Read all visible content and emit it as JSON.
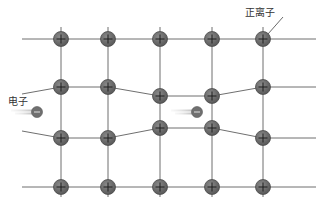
{
  "diagram": {
    "type": "metal-lattice",
    "labels": {
      "positive_ion": "正离子",
      "electron": "电子"
    },
    "colors": {
      "line": "#6f6f6f",
      "ion_fill": "#6a6a6a",
      "ion_stroke": "#4a4a4a",
      "ion_symbol": "#1e1e1e",
      "electron_fill": "#707070",
      "trail": "#cfcfcf"
    },
    "grid": {
      "x_start": 22,
      "x_end": 316,
      "columns": [
        61,
        108,
        160,
        212,
        263
      ],
      "rows": [
        {
          "ys": [
            39,
            39,
            39,
            39,
            39
          ],
          "y_left": 39,
          "y_right": 39
        },
        {
          "ys": [
            87,
            87,
            96,
            96,
            87
          ],
          "y_left": 94,
          "y_right": 87
        },
        {
          "ys": [
            138,
            138,
            128,
            128,
            138
          ],
          "y_left": 131,
          "y_right": 138
        },
        {
          "ys": [
            187,
            187,
            187,
            187,
            187
          ],
          "y_left": 187,
          "y_right": 187
        }
      ]
    },
    "ions": {
      "symbol": "+",
      "radius": 7.5
    },
    "electrons": [
      {
        "x": 37,
        "y": 112,
        "symbol": "−"
      },
      {
        "x": 197,
        "y": 112,
        "symbol": "−"
      }
    ],
    "label_positions": {
      "positive_ion": {
        "x": 245,
        "y": 4
      },
      "electron": {
        "x": 8,
        "y": 93
      }
    },
    "pointer": {
      "x1": 283,
      "y1": 17,
      "x2": 268,
      "y2": 34
    }
  }
}
